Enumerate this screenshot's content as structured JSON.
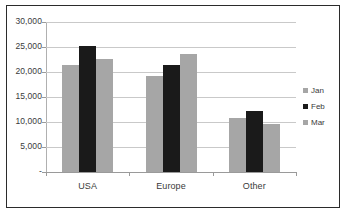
{
  "chart_data": {
    "type": "bar",
    "title": "",
    "subtitle": "",
    "xlabel": "",
    "ylabel": "",
    "categories": [
      "USA",
      "Europe",
      "Other"
    ],
    "series": [
      {
        "name": "Jan",
        "color": "#a6a6a6",
        "values": [
          21500,
          19200,
          10900
        ]
      },
      {
        "name": "Feb",
        "color": "#1a1a1a",
        "values": [
          25300,
          21400,
          12300
        ]
      },
      {
        "name": "Mar",
        "color": "#a6a6a6",
        "values": [
          22700,
          23700,
          9700
        ]
      }
    ],
    "ylim": [
      0,
      30000
    ],
    "ytick_values": [
      0,
      5000,
      10000,
      15000,
      20000,
      25000,
      30000
    ],
    "ytick_labels": [
      "-",
      "5,000",
      "10,000",
      "15,000",
      "20,000",
      "25,000",
      "30,000"
    ],
    "grid": true,
    "legend_position": "right",
    "orientation": "vertical",
    "grouping": "clustered"
  },
  "axis": {
    "y_labels": [
      {
        "text": "30,000",
        "value": 30000
      },
      {
        "text": "25,000",
        "value": 25000
      },
      {
        "text": "20,000",
        "value": 20000
      },
      {
        "text": "15,000",
        "value": 15000
      },
      {
        "text": "10,000",
        "value": 10000
      },
      {
        "text": "5,000",
        "value": 5000
      },
      {
        "text": "-",
        "value": 0
      }
    ],
    "x_labels": [
      "USA",
      "Europe",
      "Other"
    ]
  },
  "legend": {
    "items": [
      {
        "label": "Jan",
        "color": "#a6a6a6"
      },
      {
        "label": "Feb",
        "color": "#1a1a1a"
      },
      {
        "label": "Mar",
        "color": "#a6a6a6"
      }
    ]
  },
  "colors": {
    "border": "#2b2b2b",
    "gridline": "#c9c9c9",
    "axis": "#9a9a9a",
    "text": "#3a3a3a",
    "background": "#ffffff"
  }
}
